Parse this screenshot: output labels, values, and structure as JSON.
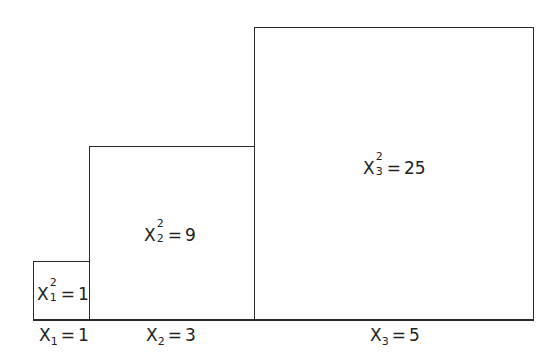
{
  "diagram": {
    "type": "squares-area-illustration",
    "line_color": "#2a2a2a",
    "squares": [
      {
        "id": "x1",
        "side": 1,
        "area_label": {
          "var": "X",
          "sub": "1",
          "sup": "2",
          "value": "1"
        },
        "base_label": {
          "var": "X",
          "sub": "1",
          "value": "1"
        }
      },
      {
        "id": "x2",
        "side": 3,
        "area_label": {
          "var": "X",
          "sub": "2",
          "sup": "2",
          "value": "9"
        },
        "base_label": {
          "var": "X",
          "sub": "2",
          "value": "3"
        }
      },
      {
        "id": "x3",
        "side": 5,
        "area_label": {
          "var": "X",
          "sub": "3",
          "sup": "2",
          "value": "25"
        },
        "base_label": {
          "var": "X",
          "sub": "3",
          "value": "5"
        }
      }
    ],
    "equals": "="
  }
}
